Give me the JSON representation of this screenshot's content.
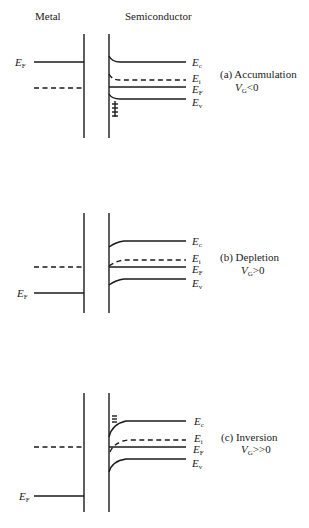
{
  "headers": {
    "metal": "Metal",
    "semiconductor": "Semiconductor"
  },
  "panels": [
    {
      "id": "a",
      "caption": "(a)  Accumulation",
      "condition_main": "V",
      "condition_sub": "G",
      "condition_rel": "<0",
      "metal_fermi_label": "E",
      "metal_fermi_sub": "F",
      "bands": [
        {
          "name": "E",
          "sub": "c"
        },
        {
          "name": "E",
          "sub": "i"
        },
        {
          "name": "E",
          "sub": "F"
        },
        {
          "name": "E",
          "sub": "v"
        }
      ],
      "annotation": "accumulated holes (+ charges) at surface"
    },
    {
      "id": "b",
      "caption": "(b)  Depletion",
      "condition_main": "V",
      "condition_sub": "G",
      "condition_rel": ">0",
      "metal_fermi_label": "E",
      "metal_fermi_sub": "F",
      "bands": [
        {
          "name": "E",
          "sub": "c"
        },
        {
          "name": "E",
          "sub": "i"
        },
        {
          "name": "E",
          "sub": "F"
        },
        {
          "name": "E",
          "sub": "v"
        }
      ]
    },
    {
      "id": "c",
      "caption": "(c)  Inversion",
      "condition_main": "V",
      "condition_sub": "G",
      "condition_rel": ">>0",
      "metal_fermi_label": "E",
      "metal_fermi_sub": "F",
      "bands": [
        {
          "name": "E",
          "sub": "c"
        },
        {
          "name": "E",
          "sub": "i"
        },
        {
          "name": "E",
          "sub": "F"
        },
        {
          "name": "E",
          "sub": "v"
        }
      ],
      "annotation": "inversion electrons (≡) at surface"
    }
  ]
}
